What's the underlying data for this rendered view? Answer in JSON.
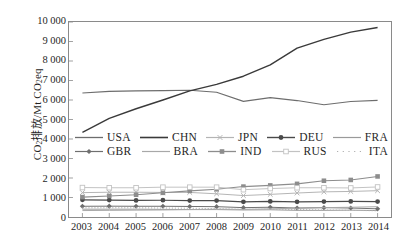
{
  "figure": {
    "y_axis_title_prefix": "CO",
    "y_axis_title_sub1": "2",
    "y_axis_title_mid": "排放/Mt CO",
    "y_axis_title_sub2": "2",
    "y_axis_title_suffix": "eq"
  },
  "chart_data": {
    "type": "line",
    "title": "",
    "xlabel": "",
    "ylabel": "CO2排放/Mt CO2eq",
    "categories": [
      "2003",
      "2004",
      "2005",
      "2006",
      "2007",
      "2008",
      "2009",
      "2010",
      "2011",
      "2012",
      "2013",
      "2014"
    ],
    "x": [
      2003,
      2004,
      2005,
      2006,
      2007,
      2008,
      2009,
      2010,
      2011,
      2012,
      2013,
      2014
    ],
    "ylim": [
      0,
      10000
    ],
    "yticks": [
      "0",
      "1 000",
      "2 000",
      "3 000",
      "4 000",
      "5 000",
      "6 000",
      "7 000",
      "8 000",
      "9 000",
      "10 000"
    ],
    "ytick_values": [
      0,
      1000,
      2000,
      3000,
      4000,
      5000,
      6000,
      7000,
      8000,
      9000,
      10000
    ],
    "grid": false,
    "legend_position": "center",
    "series": [
      {
        "name": "USA",
        "marker": "none",
        "color": "#6d6d6d",
        "width": 1.1,
        "dash": "none",
        "values": [
          6360,
          6440,
          6470,
          6480,
          6500,
          6400,
          5930,
          6120,
          5970,
          5760,
          5920,
          5980
        ]
      },
      {
        "name": "CHN",
        "marker": "none",
        "color": "#3a3a3a",
        "width": 1.4,
        "dash": "none",
        "values": [
          4340,
          5060,
          5550,
          6000,
          6470,
          6800,
          7220,
          7800,
          8660,
          9110,
          9480,
          9720
        ]
      },
      {
        "name": "JPN",
        "marker": "x",
        "color": "#b4b4b4",
        "width": 1.0,
        "dash": "none",
        "values": [
          1250,
          1270,
          1270,
          1260,
          1260,
          1190,
          1100,
          1160,
          1230,
          1290,
          1310,
          1350
        ]
      },
      {
        "name": "DEU",
        "marker": "circle",
        "color": "#4a4a4a",
        "width": 1.2,
        "dash": "none",
        "values": [
          880,
          870,
          850,
          860,
          840,
          840,
          780,
          800,
          780,
          790,
          800,
          790
        ]
      },
      {
        "name": "FRA",
        "marker": "none",
        "color": "#9a9a9a",
        "width": 1.0,
        "dash": "none",
        "values": [
          400,
          400,
          400,
          390,
          380,
          380,
          360,
          370,
          340,
          340,
          350,
          330
        ]
      },
      {
        "name": "GBR",
        "marker": "diamond",
        "color": "#6f6f6f",
        "width": 1.0,
        "dash": "none",
        "values": [
          550,
          555,
          550,
          550,
          540,
          530,
          480,
          500,
          460,
          480,
          460,
          420
        ]
      },
      {
        "name": "BRA",
        "marker": "none",
        "color": "#a8a8a8",
        "width": 1.0,
        "dash": "none",
        "values": [
          330,
          340,
          350,
          360,
          380,
          400,
          390,
          420,
          450,
          480,
          500,
          530
        ]
      },
      {
        "name": "IND",
        "marker": "square",
        "color": "#8d8d8d",
        "width": 1.1,
        "dash": "none",
        "values": [
          1020,
          1080,
          1140,
          1240,
          1340,
          1420,
          1560,
          1620,
          1700,
          1860,
          1900,
          2080
        ]
      },
      {
        "name": "RUS",
        "marker": "square-open",
        "color": "#c2c2c2",
        "width": 1.0,
        "dash": "none",
        "values": [
          1510,
          1500,
          1500,
          1530,
          1530,
          1530,
          1400,
          1460,
          1500,
          1500,
          1490,
          1540
        ]
      },
      {
        "name": "ITA",
        "marker": "none",
        "color": "#b0b0b0",
        "width": 1.0,
        "dash": "dotted",
        "values": [
          470,
          475,
          470,
          460,
          450,
          430,
          390,
          400,
          380,
          360,
          340,
          320
        ]
      }
    ]
  },
  "legend": {
    "rows": [
      [
        {
          "label": "USA",
          "marker": "none"
        },
        {
          "label": "CHN",
          "marker": "none"
        },
        {
          "label": "JPN",
          "marker": "x"
        },
        {
          "label": "DEU",
          "marker": "circle"
        },
        {
          "label": "FRA",
          "marker": "none"
        }
      ],
      [
        {
          "label": "GBR",
          "marker": "diamond"
        },
        {
          "label": "BRA",
          "marker": "none"
        },
        {
          "label": "IND",
          "marker": "square"
        },
        {
          "label": "RUS",
          "marker": "square-open"
        },
        {
          "label": "ITA",
          "marker": "dotted"
        }
      ]
    ]
  }
}
